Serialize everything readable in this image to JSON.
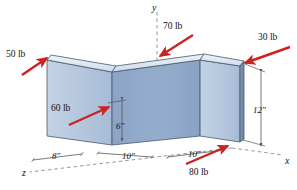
{
  "figure": {
    "kind": "isometric-free-body-diagram",
    "background": "#ffffff"
  },
  "colors": {
    "force_arrow": "#cc2222",
    "panel_light": "#b8c9de",
    "panel_mid": "#8fa8c8",
    "panel_top": "#dce5f0",
    "edge": "#3a4a5e",
    "axis": "#8a8a8a",
    "dimension": "#555555",
    "text": "#111111"
  },
  "forces": [
    {
      "name": "force-50lb",
      "label": "50 lb",
      "label_x": 6,
      "label_y": 50,
      "tail_x": 22,
      "tail_y": 75,
      "head_x": 47,
      "head_y": 58
    },
    {
      "name": "force-70lb",
      "label": "70 lb",
      "label_x": 163,
      "label_y": 22,
      "tail_x": 193,
      "tail_y": 35,
      "head_x": 160,
      "head_y": 56
    },
    {
      "name": "force-30lb",
      "label": "30 lb",
      "label_x": 258,
      "label_y": 33,
      "tail_x": 290,
      "tail_y": 47,
      "head_x": 245,
      "head_y": 63
    },
    {
      "name": "force-60lb",
      "label": "60 lb",
      "label_x": 51,
      "label_y": 104,
      "tail_x": 69,
      "tail_y": 125,
      "head_x": 109,
      "head_y": 107
    },
    {
      "name": "force-80lb",
      "label": "80 lb",
      "label_x": 189,
      "label_y": 168,
      "tail_x": 186,
      "tail_y": 164,
      "head_x": 228,
      "head_y": 146
    }
  ],
  "dimensions": [
    {
      "name": "dim-8in",
      "label": "8\"",
      "label_x": 52,
      "label_y": 152
    },
    {
      "name": "dim-10in-left",
      "label": "10\"",
      "label_x": 122,
      "label_y": 152
    },
    {
      "name": "dim-10in-right",
      "label": "10\"",
      "label_x": 188,
      "label_y": 150
    },
    {
      "name": "dim-6in",
      "label": "6\"",
      "label_x": 116,
      "label_y": 122
    },
    {
      "name": "dim-12in",
      "label": "12\"",
      "label_x": 253,
      "label_y": 106
    }
  ],
  "axes": [
    {
      "name": "axis-x",
      "label": "x",
      "label_x": 285,
      "label_y": 156
    },
    {
      "name": "axis-y",
      "label": "y",
      "label_x": 152,
      "label_y": 3
    },
    {
      "name": "axis-z",
      "label": "z",
      "label_x": 22,
      "label_y": 168
    }
  ]
}
